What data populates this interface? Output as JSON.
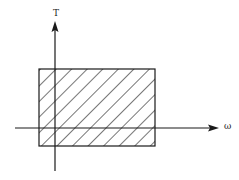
{
  "diagram": {
    "axes": {
      "horizontal_label": "ω",
      "vertical_label": "T"
    },
    "region": {
      "shape": "rectangle",
      "fill": "diagonal-hatch"
    },
    "colors": {
      "stroke": "#1a1a1a",
      "background": "#ffffff"
    }
  }
}
